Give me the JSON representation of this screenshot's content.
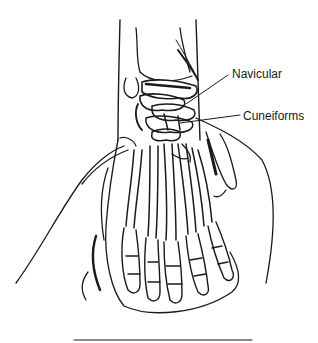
{
  "figure": {
    "labels": [
      {
        "text": "Navicular",
        "target": "navicular bone"
      },
      {
        "text": "Cuneiforms",
        "target": "cuneiform bones"
      }
    ]
  },
  "colors": {
    "background": "#ffffff",
    "ink": "#1a1a1a"
  }
}
